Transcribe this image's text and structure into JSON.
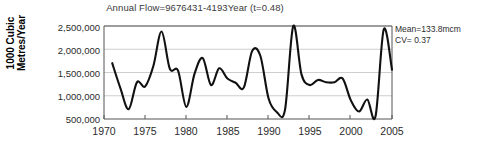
{
  "chart_data": {
    "type": "line",
    "title": "Annual Flow=9676431-4193Year (t=0.48)",
    "xlabel": "",
    "ylabel": "1000 Cubic Metres/Year",
    "ylabel_line1": "1000 Cubic",
    "ylabel_line2": "Metres/Year",
    "xlim": [
      1970,
      2005
    ],
    "ylim": [
      500000,
      2500000
    ],
    "grid": true,
    "legend": "none",
    "ytick_labels": [
      "2,500,000",
      "2,000,000",
      "1,500,000",
      "1,000,000",
      "500,000"
    ],
    "ytick_values": [
      2500000,
      2000000,
      1500000,
      1000000,
      500000
    ],
    "xtick_labels": [
      "1970",
      "1975",
      "1980",
      "1985",
      "1990",
      "1995",
      "2000",
      "2005"
    ],
    "xtick_values": [
      1970,
      1975,
      1980,
      1985,
      1990,
      1995,
      2000,
      2005
    ],
    "series": [
      {
        "name": "Annual Flow",
        "x": [
          1971,
          1972,
          1973,
          1974,
          1975,
          1976,
          1977,
          1978,
          1979,
          1980,
          1981,
          1982,
          1983,
          1984,
          1985,
          1986,
          1987,
          1988,
          1989,
          1990,
          1991,
          1992,
          1993,
          1994,
          1995,
          1996,
          1997,
          1998,
          1999,
          2000,
          2001,
          2002,
          2003,
          2004,
          2005
        ],
        "values": [
          1700000,
          1160000,
          710000,
          1290000,
          1200000,
          1640000,
          2380000,
          1580000,
          1540000,
          760000,
          1470000,
          1810000,
          1230000,
          1590000,
          1370000,
          1280000,
          1180000,
          1960000,
          1860000,
          940000,
          650000,
          700000,
          2500000,
          1460000,
          1230000,
          1340000,
          1290000,
          1290000,
          1370000,
          900000,
          660000,
          920000,
          560000,
          2430000,
          1560000
        ]
      }
    ],
    "annotations": [
      {
        "id": "mean",
        "text": "Mean=133.8mcm"
      },
      {
        "id": "cv",
        "text": "CV= 0.37"
      }
    ],
    "line_color": "#111111",
    "grid_color": "#b9b9b9",
    "axis_color": "#555555"
  }
}
